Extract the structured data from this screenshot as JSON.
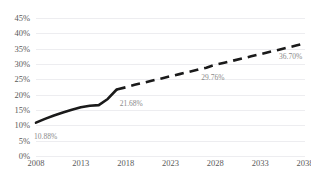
{
  "chart_data": {
    "type": "line",
    "title": "",
    "xlabel": "",
    "ylabel": "",
    "ylim": [
      0,
      45
    ],
    "xlim": [
      2008,
      2038
    ],
    "grid": true,
    "legend": false,
    "y_tick_labels": [
      "45%",
      "40%",
      "35%",
      "30%",
      "25%",
      "20%",
      "15%",
      "10%",
      "5%",
      "0%"
    ],
    "y_tick_values": [
      45,
      40,
      35,
      30,
      25,
      20,
      15,
      10,
      5,
      0
    ],
    "x_tick_labels": [
      "2008",
      "2013",
      "2018",
      "2023",
      "2028",
      "2033",
      "2038"
    ],
    "x_tick_values": [
      2008,
      2013,
      2018,
      2023,
      2028,
      2033,
      2038
    ],
    "series": [
      {
        "name": "Historical",
        "style": "solid",
        "color": "#1a1a1a",
        "x": [
          2008,
          2009,
          2010,
          2011,
          2012,
          2013,
          2014,
          2015,
          2016,
          2017
        ],
        "values": [
          10.88,
          12.1,
          13.2,
          14.2,
          15.1,
          15.9,
          16.4,
          16.6,
          18.6,
          21.68
        ]
      },
      {
        "name": "Forecast",
        "style": "dashed",
        "color": "#1a1a1a",
        "x": [
          2017,
          2018,
          2019,
          2020,
          2021,
          2022,
          2023,
          2024,
          2025,
          2026,
          2027,
          2028,
          2029,
          2030,
          2031,
          2032,
          2033,
          2034,
          2035,
          2036,
          2037,
          2038
        ],
        "values": [
          21.68,
          22.4,
          23.2,
          23.9,
          24.6,
          25.3,
          26.0,
          26.7,
          27.4,
          28.1,
          28.8,
          29.76,
          30.4,
          31.1,
          31.8,
          32.5,
          33.2,
          33.9,
          34.6,
          35.3,
          36.0,
          36.7
        ]
      }
    ],
    "data_labels": [
      {
        "name": "start-value",
        "text": "10.88%",
        "x": 2008,
        "y": 10.88
      },
      {
        "name": "historical-end-value",
        "text": "21.68%",
        "x": 2017,
        "y": 21.68
      },
      {
        "name": "mid-forecast-value",
        "text": "29.76%",
        "x": 2028,
        "y": 29.76
      },
      {
        "name": "forecast-end-value",
        "text": "36.70%",
        "x": 2038,
        "y": 36.7
      }
    ]
  }
}
